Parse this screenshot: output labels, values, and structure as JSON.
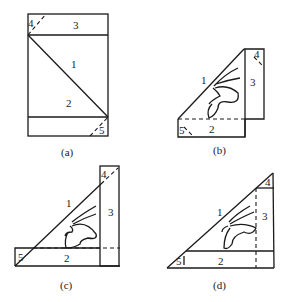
{
  "panels": [
    {
      "id": "a",
      "caption": "(a)",
      "labels": {
        "1": "1",
        "2": "2",
        "3": "3",
        "4": "4",
        "5": "5"
      }
    },
    {
      "id": "b",
      "caption": "(b)",
      "labels": {
        "1": "1",
        "2": "2",
        "3": "3",
        "4": "4",
        "5": "5"
      }
    },
    {
      "id": "c",
      "caption": "(c)",
      "labels": {
        "1": "1",
        "2": "2",
        "3": "3",
        "4": "4",
        "5": "5"
      }
    },
    {
      "id": "d",
      "caption": "(d)",
      "labels": {
        "1": "1",
        "2": "2",
        "3": "3",
        "4": "4",
        "5": "5"
      }
    }
  ],
  "colors": {
    "ink": "#1a1a1a",
    "background": "#ffffff"
  }
}
